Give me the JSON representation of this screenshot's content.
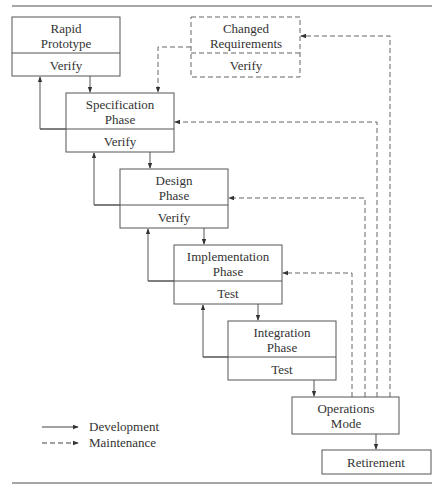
{
  "diagram": {
    "type": "waterfall-model-with-rapid-prototype",
    "colors": {
      "line": "#555555",
      "rule": "#888888",
      "text": "#333333",
      "background": "#ffffff"
    },
    "nodes": [
      {
        "id": "rapid-prototype",
        "title_lines": [
          "Rapid",
          "Prototype"
        ],
        "sub": "Verify",
        "style": "solid"
      },
      {
        "id": "changed-requirements",
        "title_lines": [
          "Changed",
          "Requirements"
        ],
        "sub": "Verify",
        "style": "dashed"
      },
      {
        "id": "specification-phase",
        "title_lines": [
          "Specification",
          "Phase"
        ],
        "sub": "Verify",
        "style": "solid"
      },
      {
        "id": "design-phase",
        "title_lines": [
          "Design",
          "Phase"
        ],
        "sub": "Verify",
        "style": "solid"
      },
      {
        "id": "implementation-phase",
        "title_lines": [
          "Implementation",
          "Phase"
        ],
        "sub": "Test",
        "style": "solid"
      },
      {
        "id": "integration-phase",
        "title_lines": [
          "Integration",
          "Phase"
        ],
        "sub": "Test",
        "style": "solid"
      },
      {
        "id": "operations-mode",
        "title_lines": [
          "Operations",
          "Mode"
        ],
        "sub": "",
        "style": "solid"
      },
      {
        "id": "retirement",
        "title_lines": [
          "Retirement"
        ],
        "sub": "",
        "style": "solid"
      }
    ],
    "edges": [
      {
        "from": "rapid-prototype",
        "to": "specification-phase",
        "kind": "development"
      },
      {
        "from": "specification-phase",
        "to": "rapid-prototype",
        "kind": "development"
      },
      {
        "from": "changed-requirements",
        "to": "specification-phase",
        "kind": "maintenance"
      },
      {
        "from": "specification-phase",
        "to": "design-phase",
        "kind": "development"
      },
      {
        "from": "design-phase",
        "to": "specification-phase",
        "kind": "development"
      },
      {
        "from": "design-phase",
        "to": "implementation-phase",
        "kind": "development"
      },
      {
        "from": "implementation-phase",
        "to": "design-phase",
        "kind": "development"
      },
      {
        "from": "implementation-phase",
        "to": "integration-phase",
        "kind": "development"
      },
      {
        "from": "integration-phase",
        "to": "implementation-phase",
        "kind": "development"
      },
      {
        "from": "integration-phase",
        "to": "operations-mode",
        "kind": "development"
      },
      {
        "from": "operations-mode",
        "to": "retirement",
        "kind": "development"
      },
      {
        "from": "operations-mode",
        "to": "implementation-phase",
        "kind": "maintenance"
      },
      {
        "from": "operations-mode",
        "to": "design-phase",
        "kind": "maintenance"
      },
      {
        "from": "operations-mode",
        "to": "specification-phase",
        "kind": "maintenance"
      },
      {
        "from": "operations-mode",
        "to": "changed-requirements",
        "kind": "maintenance"
      }
    ],
    "legend": [
      {
        "kind": "development",
        "line": "solid",
        "label": "Development"
      },
      {
        "kind": "maintenance",
        "line": "dashed",
        "label": "Maintenance"
      }
    ]
  }
}
